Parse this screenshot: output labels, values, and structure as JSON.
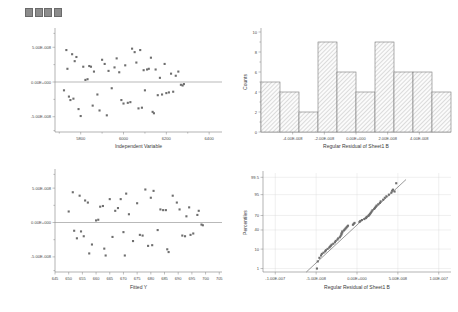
{
  "toolbar": {
    "name": "plot-toolbar",
    "squares": [
      "square-1",
      "square-2",
      "square-3",
      "square-4"
    ]
  },
  "chart_data": [
    {
      "id": "residual-vs-independent",
      "type": "scatter",
      "title": "",
      "xlabel": "Independent Variable",
      "ylabel": "",
      "xticks": [
        "5800",
        "6000",
        "6200",
        "6400"
      ],
      "xtick_values": [
        5800,
        6000,
        6200,
        6400
      ],
      "yticks": [
        "5.00E-008",
        "0.00E+000",
        "-5.00E-008"
      ],
      "ytick_values": [
        5e-08,
        0,
        -5e-08
      ],
      "xlim": [
        5680,
        6460
      ],
      "ylim": [
        -7.2e-08,
        7.2e-08
      ],
      "grid": false,
      "zero_reference_line": true,
      "points": [
        [
          5722,
          -1.2e-08
        ],
        [
          5733,
          4.6e-08
        ],
        [
          5738,
          1.9e-08
        ],
        [
          5745,
          -2.1e-08
        ],
        [
          5752,
          -2.6e-08
        ],
        [
          5760,
          4e-08
        ],
        [
          5766,
          -2.4e-08
        ],
        [
          5772,
          3e-08
        ],
        [
          5780,
          3.6e-08
        ],
        [
          5790,
          -3.9e-08
        ],
        [
          5800,
          -4.9e-08
        ],
        [
          5812,
          2.2e-08
        ],
        [
          5822,
          3e-09
        ],
        [
          5832,
          4e-09
        ],
        [
          5840,
          2.3e-08
        ],
        [
          5848,
          2.2e-08
        ],
        [
          5856,
          -3.4e-08
        ],
        [
          5862,
          1.5e-08
        ],
        [
          5878,
          -1.8e-08
        ],
        [
          5888,
          -4.1e-08
        ],
        [
          5900,
          3.2e-08
        ],
        [
          5912,
          2.6e-08
        ],
        [
          5922,
          -4.8e-08
        ],
        [
          5930,
          1.6e-08
        ],
        [
          5945,
          -9e-09
        ],
        [
          5958,
          2.1e-08
        ],
        [
          5968,
          3.4e-08
        ],
        [
          5980,
          1.4e-08
        ],
        [
          5990,
          -2.6e-08
        ],
        [
          6000,
          -3.1e-08
        ],
        [
          6008,
          2.4e-08
        ],
        [
          6020,
          -3e-08
        ],
        [
          6032,
          -2.9e-08
        ],
        [
          6040,
          4.8e-08
        ],
        [
          6052,
          4.3e-08
        ],
        [
          6060,
          2.8e-08
        ],
        [
          6070,
          -3.8e-08
        ],
        [
          6078,
          4.6e-08
        ],
        [
          6086,
          -3.7e-08
        ],
        [
          6094,
          1.7e-08
        ],
        [
          6100,
          -1.2e-08
        ],
        [
          6110,
          1.8e-08
        ],
        [
          6118,
          1.9e-08
        ],
        [
          6128,
          3.5e-08
        ],
        [
          6136,
          -4.3e-08
        ],
        [
          6142,
          -4.5e-08
        ],
        [
          6150,
          1.8e-08
        ],
        [
          6160,
          -1.9e-08
        ],
        [
          6170,
          6e-09
        ],
        [
          6180,
          -1.8e-08
        ],
        [
          6192,
          2.6e-08
        ],
        [
          6200,
          -1.6e-08
        ],
        [
          6212,
          -1.5e-08
        ],
        [
          6222,
          1.2e-08
        ],
        [
          6232,
          -1.4e-08
        ],
        [
          6244,
          9e-09
        ],
        [
          6256,
          1.5e-08
        ],
        [
          6268,
          -4e-09
        ],
        [
          6276,
          -5e-09
        ],
        [
          6282,
          -3e-09
        ]
      ]
    },
    {
      "id": "residual-histogram",
      "type": "bar",
      "title": "",
      "xlabel": "Regular Residual of Sheet1 B",
      "ylabel": "Counts",
      "xticks": [
        "-4.00E-008",
        "-2.00E-008",
        "0.00E+000",
        "2.00E-008",
        "4.00E-008"
      ],
      "xtick_values": [
        -4e-08,
        -2e-08,
        0,
        2e-08,
        4e-08
      ],
      "yticks": [
        "0",
        "2",
        "4",
        "6",
        "8",
        "10"
      ],
      "ylim": [
        0,
        10
      ],
      "xlim": [
        -6e-08,
        6e-08
      ],
      "bin_width": 1.2e-08,
      "categories": [
        "-5.4E-8",
        "-4.2E-8",
        "-3.0E-8",
        "-1.8E-8",
        "-0.6E-8",
        "0.6E-8",
        "1.8E-8",
        "3.0E-8",
        "4.2E-8",
        "5.4E-8"
      ],
      "values": [
        5,
        4,
        2,
        9,
        6,
        4,
        9,
        6,
        6,
        4
      ],
      "grid": false,
      "legend": ""
    },
    {
      "id": "residual-vs-fitted",
      "type": "scatter",
      "title": "",
      "xlabel": "Fitted Y",
      "ylabel": "",
      "xticks": [
        "645",
        "650",
        "655",
        "660",
        "665",
        "670",
        "675",
        "680",
        "685",
        "690",
        "695",
        "700",
        "705"
      ],
      "xtick_values": [
        645,
        650,
        655,
        660,
        665,
        670,
        675,
        680,
        685,
        690,
        695,
        700,
        705
      ],
      "yticks": [
        "5.00E-008",
        "0.00E+000",
        "-5.00E-008"
      ],
      "ytick_values": [
        5e-08,
        0,
        -5e-08
      ],
      "xlim": [
        645,
        706
      ],
      "ylim": [
        -7.2e-08,
        7.2e-08
      ],
      "grid": false,
      "zero_reference_line": true,
      "points": [
        [
          650.0,
          1.6e-08
        ],
        [
          651.5,
          4.4e-08
        ],
        [
          652.0,
          -1.2e-08
        ],
        [
          653.0,
          -2.3e-08
        ],
        [
          654.0,
          3.9e-08
        ],
        [
          654.5,
          -1.3e-08
        ],
        [
          655.5,
          -2e-08
        ],
        [
          656.0,
          3.2e-08
        ],
        [
          657.0,
          2.9e-08
        ],
        [
          657.5,
          -4.5e-08
        ],
        [
          658.5,
          -3.2e-08
        ],
        [
          660.0,
          3e-09
        ],
        [
          660.8,
          4e-09
        ],
        [
          661.5,
          2.3e-08
        ],
        [
          662.5,
          2.4e-08
        ],
        [
          663.0,
          -3.8e-08
        ],
        [
          663.5,
          -4.8e-08
        ],
        [
          665.0,
          3.4e-08
        ],
        [
          666.0,
          -2.1e-08
        ],
        [
          667.0,
          1.7e-08
        ],
        [
          668.0,
          2.1e-08
        ],
        [
          669.0,
          3.4e-08
        ],
        [
          670.0,
          -1.4e-08
        ],
        [
          670.5,
          -4.8e-08
        ],
        [
          671.0,
          4.2e-08
        ],
        [
          672.0,
          1.2e-08
        ],
        [
          673.5,
          -2.7e-08
        ],
        [
          675.0,
          2.8e-08
        ],
        [
          676.0,
          -1.8e-08
        ],
        [
          677.0,
          -1.9e-08
        ],
        [
          678.0,
          4.8e-08
        ],
        [
          679.0,
          -3.4e-08
        ],
        [
          680.0,
          3.6e-08
        ],
        [
          680.5,
          -3.3e-08
        ],
        [
          681.0,
          4.6e-08
        ],
        [
          682.5,
          -1.1e-08
        ],
        [
          683.5,
          1.9e-08
        ],
        [
          684.5,
          1.8e-08
        ],
        [
          685.5,
          1.8e-08
        ],
        [
          686.0,
          -3.9e-08
        ],
        [
          686.5,
          -4.3e-08
        ],
        [
          688.0,
          3.9e-08
        ],
        [
          689.5,
          2.9e-08
        ],
        [
          690.5,
          1.9e-08
        ],
        [
          691.5,
          -1.9e-08
        ],
        [
          692.5,
          -2e-08
        ],
        [
          693.0,
          9e-09
        ],
        [
          694.0,
          2.2e-08
        ],
        [
          694.5,
          -1.8e-08
        ],
        [
          695.5,
          -1.6e-08
        ],
        [
          697.0,
          1.1e-08
        ],
        [
          697.5,
          1.7e-08
        ],
        [
          698.5,
          -3e-09
        ],
        [
          699.0,
          -4e-09
        ]
      ]
    },
    {
      "id": "normal-probability-plot",
      "type": "scatter",
      "title": "",
      "xlabel": "Regular Residual of Sheet1 B",
      "ylabel": "Percentiles",
      "xticks": [
        "-1.00E-007",
        "-5.00E-008",
        "0.00E+000",
        "5.00E-008",
        "1.00E-007"
      ],
      "xtick_values": [
        -1e-07,
        -5e-08,
        0,
        5e-08,
        1e-07
      ],
      "yticks": [
        "1",
        "10",
        "40",
        "70",
        "95",
        "99.5"
      ],
      "ytick_values": [
        1,
        10,
        40,
        70,
        95,
        99.5
      ],
      "xlim": [
        -1.15e-07,
        1.15e-07
      ],
      "grid": true,
      "reference_line": true,
      "points": [
        [
          -4.9e-08,
          1.0
        ],
        [
          -4.8e-08,
          2.6
        ],
        [
          -4.6e-08,
          4.0
        ],
        [
          -4.4e-08,
          5.2
        ],
        [
          -4.3e-08,
          6.2
        ],
        [
          -4.1e-08,
          7.0
        ],
        [
          -3.9e-08,
          8.0
        ],
        [
          -3.8e-08,
          9.0
        ],
        [
          -3.6e-08,
          10.2
        ],
        [
          -3.4e-08,
          11.5
        ],
        [
          -3.3e-08,
          12.5
        ],
        [
          -3.2e-08,
          13.5
        ],
        [
          -3.1e-08,
          14.8
        ],
        [
          -2.9e-08,
          16.0
        ],
        [
          -2.7e-08,
          18.0
        ],
        [
          -2.6e-08,
          20.0
        ],
        [
          -2.4e-08,
          22.0
        ],
        [
          -2.3e-08,
          24.0
        ],
        [
          -2.1e-08,
          26.0
        ],
        [
          -2e-08,
          28.5
        ],
        [
          -1.9e-08,
          31.0
        ],
        [
          -1.9e-08,
          33.0
        ],
        [
          -1.8e-08,
          35.0
        ],
        [
          -1.8e-08,
          37.0
        ],
        [
          -1.6e-08,
          39.0
        ],
        [
          -1.5e-08,
          41.0
        ],
        [
          -1.4e-08,
          43.0
        ],
        [
          -1.3e-08,
          45.0
        ],
        [
          -1.2e-08,
          47.0
        ],
        [
          -1.1e-08,
          49.0
        ],
        [
          -5e-09,
          51.0
        ],
        [
          -4e-09,
          53.0
        ],
        [
          -3e-09,
          55.0
        ],
        [
          3e-09,
          57.0
        ],
        [
          4e-09,
          59.0
        ],
        [
          6e-09,
          61.0
        ],
        [
          9e-09,
          63.0
        ],
        [
          1.1e-08,
          65.0
        ],
        [
          1.2e-08,
          67.0
        ],
        [
          1.4e-08,
          69.0
        ],
        [
          1.5e-08,
          71.0
        ],
        [
          1.6e-08,
          73.0
        ],
        [
          1.7e-08,
          75.0
        ],
        [
          1.8e-08,
          77.0
        ],
        [
          1.9e-08,
          79.0
        ],
        [
          2.1e-08,
          81.0
        ],
        [
          2.2e-08,
          82.5
        ],
        [
          2.3e-08,
          84.0
        ],
        [
          2.4e-08,
          85.5
        ],
        [
          2.6e-08,
          87.0
        ],
        [
          2.8e-08,
          88.5
        ],
        [
          2.9e-08,
          90.0
        ],
        [
          3.2e-08,
          91.5
        ],
        [
          3.4e-08,
          93.0
        ],
        [
          3.6e-08,
          94.0
        ],
        [
          3.9e-08,
          95.0
        ],
        [
          4.2e-08,
          96.0
        ],
        [
          4.3e-08,
          96.8
        ],
        [
          4.4e-08,
          97.2
        ],
        [
          4.6e-08,
          96.5
        ],
        [
          4.8e-08,
          98.8
        ]
      ]
    }
  ]
}
